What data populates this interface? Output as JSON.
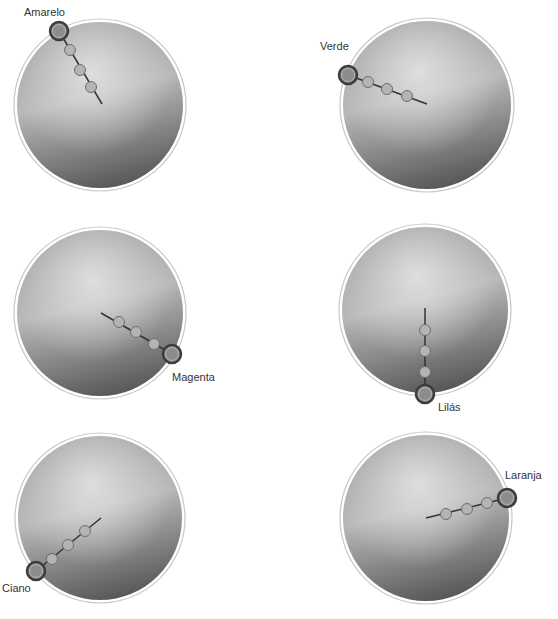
{
  "colors": {
    "disk_light": "#e6e6e6",
    "disk_mid": "#9a9a9a",
    "disk_dark": "#585858",
    "outer_ring": "#c8c8c8",
    "line": "#333333",
    "node_fill": "#b4b4b4",
    "node_stroke": "#6e6e6e",
    "knob_outer": "#3c3c3c",
    "knob_inner": "#8c8c8c",
    "label": "#333333"
  },
  "dials": [
    {
      "name": "Amarelo",
      "label": "Amarelo",
      "cx": 100,
      "cy": 105,
      "r": 83,
      "knob": [
        59,
        31
      ],
      "nodes": [
        [
          70,
          50
        ],
        [
          80,
          70
        ],
        [
          91,
          87
        ]
      ],
      "line_end": [
        102,
        104
      ],
      "label_pos": [
        24,
        6
      ]
    },
    {
      "name": "Verde",
      "label": "Verde",
      "cx": 427,
      "cy": 105,
      "r": 84,
      "knob": [
        348,
        75
      ],
      "nodes": [
        [
          368,
          82
        ],
        [
          387,
          89
        ],
        [
          407,
          96
        ]
      ],
      "line_end": [
        427,
        104
      ],
      "label_pos": [
        320,
        40
      ]
    },
    {
      "name": "Magenta",
      "label": "Magenta",
      "cx": 100,
      "cy": 313,
      "r": 83,
      "knob": [
        172,
        354
      ],
      "nodes": [
        [
          154,
          344
        ],
        [
          136,
          332
        ],
        [
          119,
          322
        ]
      ],
      "line_end": [
        101,
        313
      ],
      "label_pos": [
        172,
        371
      ]
    },
    {
      "name": "Lilás",
      "label": "Lilás",
      "cx": 425,
      "cy": 310,
      "r": 83,
      "knob": [
        425,
        394
      ],
      "nodes": [
        [
          425,
          372
        ],
        [
          425,
          351
        ],
        [
          425,
          330
        ]
      ],
      "line_end": [
        425,
        308
      ],
      "label_pos": [
        438,
        401
      ]
    },
    {
      "name": "Ciano",
      "label": "Ciano",
      "cx": 100,
      "cy": 518,
      "r": 82,
      "knob": [
        36,
        571
      ],
      "nodes": [
        [
          52,
          559
        ],
        [
          68,
          545
        ],
        [
          85,
          531
        ]
      ],
      "line_end": [
        101,
        518
      ],
      "label_pos": [
        2,
        582
      ]
    },
    {
      "name": "Laranja",
      "label": "Laranja",
      "cx": 426,
      "cy": 518,
      "r": 83,
      "knob": [
        507,
        498
      ],
      "nodes": [
        [
          487,
          503
        ],
        [
          467,
          509
        ],
        [
          446,
          514
        ]
      ],
      "line_end": [
        426,
        518
      ],
      "label_pos": [
        505,
        469
      ]
    }
  ]
}
